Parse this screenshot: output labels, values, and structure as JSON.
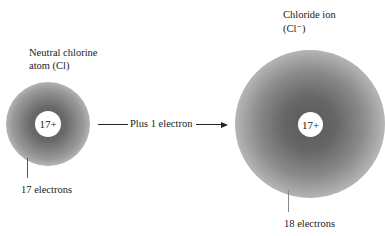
{
  "diagram": {
    "neutral_atom": {
      "title_line1": "Neutral chlorine",
      "title_line2": "atom (Cl)",
      "nucleus_charge": "17+",
      "electron_label": "17 electrons"
    },
    "reaction_arrow": {
      "label": "Plus 1 electron"
    },
    "chloride_ion": {
      "title_line1": "Chloride ion",
      "title_line2": "(Cl⁻)",
      "nucleus_charge": "17+",
      "electron_label": "18 electrons"
    },
    "colors": {
      "cloud_core": "#555555",
      "cloud_edge": "#ffffff",
      "text": "#222222"
    }
  }
}
